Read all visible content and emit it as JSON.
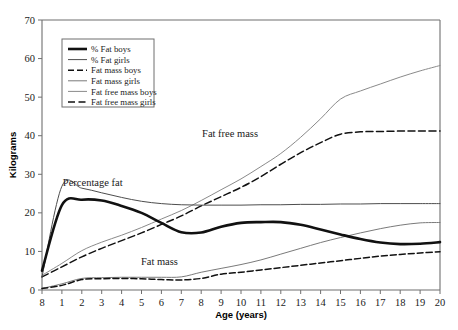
{
  "chart_data": {
    "type": "line",
    "title": "",
    "xlabel": "Age (years)",
    "ylabel": "Kilograms",
    "ylim": [
      0,
      70
    ],
    "ytick_values": [
      0,
      10,
      20,
      30,
      40,
      50,
      60,
      70
    ],
    "ytick_labels": [
      "0",
      "10",
      "20",
      "30",
      "40",
      "50",
      "60",
      "70"
    ],
    "xtick_labels": [
      "8",
      "1",
      "2",
      "3",
      "4",
      "5",
      "6",
      "7",
      "8",
      "9",
      "10",
      "11",
      "12",
      "13",
      "14",
      "15",
      "16",
      "17",
      "18",
      "19",
      "20"
    ],
    "x_positions": [
      0,
      1,
      2,
      3,
      4,
      5,
      6,
      7,
      8,
      9,
      10,
      11,
      12,
      13,
      14,
      15,
      16,
      17,
      18,
      19,
      20
    ],
    "grid": false,
    "legend_position": "top-left",
    "series": [
      {
        "name": "% Fat boys",
        "style": "thick-solid",
        "color": "#111111",
        "width": 2.6,
        "dash": "none",
        "values": [
          5.0,
          22.0,
          23.4,
          23.2,
          21.8,
          20.0,
          17.4,
          15.0,
          14.9,
          16.4,
          17.4,
          17.6,
          17.6,
          16.9,
          15.7,
          14.4,
          13.2,
          12.3,
          11.9,
          12.0,
          12.4
        ]
      },
      {
        "name": "% Fat girls",
        "style": "thin-solid",
        "color": "#4d4d4d",
        "width": 1.0,
        "dash": "none",
        "values": [
          3.4,
          26.9,
          26.4,
          25.2,
          24.0,
          23.0,
          22.4,
          22.1,
          22.0,
          22.0,
          22.0,
          22.1,
          22.1,
          22.2,
          22.2,
          22.3,
          22.3,
          22.4,
          22.4,
          22.4,
          22.4
        ]
      },
      {
        "name": "Fat mass boys",
        "style": "dashed",
        "color": "#111111",
        "width": 1.5,
        "dash": "6,3",
        "values": [
          0.4,
          1.2,
          2.7,
          2.9,
          3.0,
          2.9,
          2.7,
          2.6,
          3.0,
          4.1,
          4.6,
          5.2,
          5.8,
          6.4,
          7.0,
          7.6,
          8.2,
          8.8,
          9.2,
          9.6,
          9.9
        ]
      },
      {
        "name": "Fat mass girls",
        "style": "thin-solid",
        "color": "#7a7a7a",
        "width": 1.0,
        "dash": "none",
        "values": [
          0.4,
          1.6,
          3.0,
          3.2,
          3.3,
          3.3,
          3.3,
          3.4,
          4.6,
          5.6,
          6.6,
          7.8,
          9.3,
          10.8,
          12.3,
          13.6,
          14.8,
          15.9,
          16.8,
          17.4,
          17.5
        ]
      },
      {
        "name": "Fat free mass boys",
        "style": "dotted-thin",
        "color": "#8a8a8a",
        "width": 1.0,
        "dash": "none",
        "values": [
          3.8,
          6.9,
          10.2,
          12.4,
          14.2,
          16.2,
          18.4,
          20.6,
          23.2,
          26.0,
          28.8,
          32.0,
          35.4,
          39.6,
          44.4,
          49.5,
          51.6,
          53.4,
          55.2,
          56.8,
          58.2
        ]
      },
      {
        "name": "Fat free mass girls",
        "style": "long-dashed",
        "color": "#111111",
        "width": 1.5,
        "dash": "7,3.5",
        "values": [
          3.4,
          6.0,
          8.6,
          10.8,
          12.8,
          14.8,
          17.0,
          19.2,
          21.8,
          24.2,
          26.6,
          29.4,
          32.6,
          35.6,
          38.2,
          40.4,
          41.0,
          41.1,
          41.2,
          41.2,
          41.2
        ]
      }
    ],
    "annotations": [
      {
        "text": "Percentage fat",
        "x_value": 2.55,
        "y_value": 27.0
      },
      {
        "text": "Fat free mass",
        "x_value": 9.45,
        "y_value": 39.6
      },
      {
        "text": "Fat mass",
        "x_value": 5.9,
        "y_value": 6.6
      }
    ],
    "legend_entries": [
      "% Fat boys",
      "% Fat girls",
      "Fat mass boys",
      "Fat mass girls",
      "Fat free mass boys",
      "Fat free mass girls"
    ]
  }
}
